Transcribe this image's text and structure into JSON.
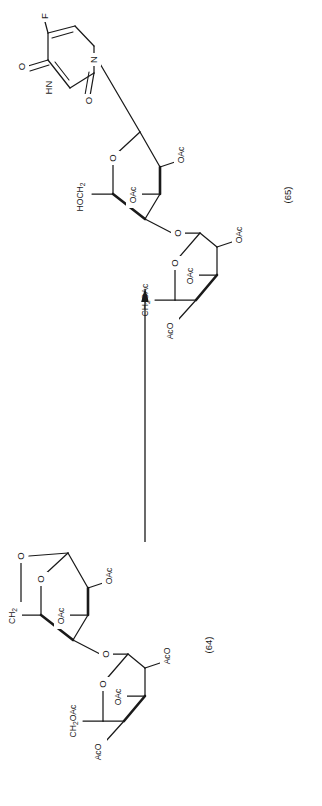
{
  "figure": {
    "orientation": "rotated-90-ccw",
    "background_color": "#ffffff",
    "line_color": "#1a1a1a"
  },
  "reaction": {
    "arrow": {
      "name": "reaction-arrow",
      "direction": "up",
      "label": ""
    },
    "reactant_label": "(64)",
    "product_label": "(65)"
  },
  "compound_64": {
    "label": "(64)",
    "ring_a": {
      "name": "anhydro-pyranose-ring",
      "ring_oxygen": "O",
      "bridge_oxygen": "O",
      "substituents": [
        "CH",
        "OAc",
        "OAc"
      ],
      "ch2_label": "CH",
      "ch2_sub": "2",
      "oac_upper": "OAc",
      "oac_lower": "OAc"
    },
    "glycosidic_oxygen": "O",
    "ring_b": {
      "name": "peracetyl-pyranose-ring",
      "ring_oxygen": "O",
      "ch2oac_label": "CH",
      "ch2oac_sub": "2",
      "ch2oac_tail": "OAc",
      "oac_mid": "OAc",
      "aco_right": "AcO",
      "aco_bottom": "AcO"
    }
  },
  "compound_65": {
    "label": "(65)",
    "base": {
      "name": "5-fluorouracil",
      "fluorine": "F",
      "n1": "N",
      "n3": "HN",
      "carbonyl_2": "O",
      "carbonyl_4": "O"
    },
    "ring_a": {
      "name": "glycosyl-pyranose-ring",
      "ring_oxygen": "O",
      "hoch2_label": "HOCH",
      "hoch2_sub": "2",
      "oac_upper": "OAc",
      "oac_mid": "OAc"
    },
    "glycosidic_oxygen": "O",
    "ring_b": {
      "name": "peracetyl-pyranose-ring",
      "ring_oxygen": "O",
      "ch2oac_label": "CH",
      "ch2oac_sub": "2",
      "ch2oac_tail": "OAc",
      "oac_mid": "OAc",
      "oac_right": "OAc",
      "aco_bottom": "AcO"
    }
  }
}
